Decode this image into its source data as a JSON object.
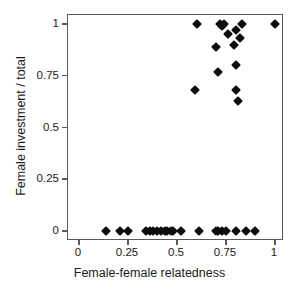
{
  "chart_data": {
    "type": "scatter",
    "title": "",
    "xlabel": "Female-female relatedness",
    "ylabel": "Female investment / total",
    "xlim": [
      0,
      1
    ],
    "ylim": [
      0,
      1
    ],
    "xticks": [
      0,
      0.25,
      0.5,
      0.75,
      1
    ],
    "yticks": [
      0,
      0.25,
      0.5,
      0.75,
      1
    ],
    "xticklabels": [
      "0",
      "0.25",
      "0.5",
      "0.75",
      "1"
    ],
    "yticklabels": [
      "0",
      "0.25",
      "0.5",
      "0.75",
      "1"
    ],
    "grid": false,
    "legend": null,
    "marker": "diamond",
    "marker_color": "#0d0d0d",
    "frame_color": "#58595b",
    "background": "#ffffff",
    "n_points": 43,
    "points": [
      {
        "x": 0.6,
        "y": 1.0
      },
      {
        "x": 0.72,
        "y": 1.0
      },
      {
        "x": 0.73,
        "y": 0.99
      },
      {
        "x": 0.74,
        "y": 1.0
      },
      {
        "x": 0.83,
        "y": 1.0
      },
      {
        "x": 1.0,
        "y": 1.0
      },
      {
        "x": 0.76,
        "y": 0.95
      },
      {
        "x": 0.8,
        "y": 0.97
      },
      {
        "x": 0.79,
        "y": 0.9
      },
      {
        "x": 0.82,
        "y": 0.93
      },
      {
        "x": 0.7,
        "y": 0.89
      },
      {
        "x": 0.71,
        "y": 0.77
      },
      {
        "x": 0.8,
        "y": 0.8
      },
      {
        "x": 0.59,
        "y": 0.68
      },
      {
        "x": 0.8,
        "y": 0.68
      },
      {
        "x": 0.81,
        "y": 0.63
      },
      {
        "x": 0.14,
        "y": 0.0
      },
      {
        "x": 0.21,
        "y": 0.0
      },
      {
        "x": 0.25,
        "y": 0.0
      },
      {
        "x": 0.34,
        "y": 0.0
      },
      {
        "x": 0.36,
        "y": 0.0
      },
      {
        "x": 0.38,
        "y": 0.0
      },
      {
        "x": 0.4,
        "y": 0.0
      },
      {
        "x": 0.42,
        "y": 0.0
      },
      {
        "x": 0.44,
        "y": 0.0
      },
      {
        "x": 0.45,
        "y": 0.0
      },
      {
        "x": 0.47,
        "y": 0.0
      },
      {
        "x": 0.48,
        "y": 0.0
      },
      {
        "x": 0.52,
        "y": 0.0
      },
      {
        "x": 0.61,
        "y": 0.0
      },
      {
        "x": 0.7,
        "y": 0.0
      },
      {
        "x": 0.71,
        "y": 0.0
      },
      {
        "x": 0.73,
        "y": 0.0
      },
      {
        "x": 0.75,
        "y": 0.0
      },
      {
        "x": 0.8,
        "y": 0.0
      },
      {
        "x": 0.85,
        "y": 0.0
      },
      {
        "x": 0.9,
        "y": 0.0
      }
    ]
  }
}
